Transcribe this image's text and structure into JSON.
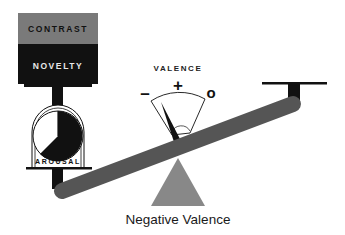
{
  "diagram": {
    "title": "Negative Valence",
    "stimulus_box": {
      "top_label": "CONTRAST",
      "bottom_label": "NOVELTY",
      "top_color": "#7a7a7a",
      "bottom_color": "#111111"
    },
    "arousal_gauge": {
      "label": "AROUSAL",
      "filled_fraction": 0.6,
      "fill_color": "#111111"
    },
    "valence_meter": {
      "title": "VALENCE",
      "left_symbol": "–",
      "center_symbol": "+",
      "right_symbol": "o",
      "needle_position": "negative"
    },
    "balance": {
      "beam_color": "#555555",
      "fulcrum_color": "#888888",
      "tilt": "left side down"
    },
    "caption": "Negative Valence"
  }
}
